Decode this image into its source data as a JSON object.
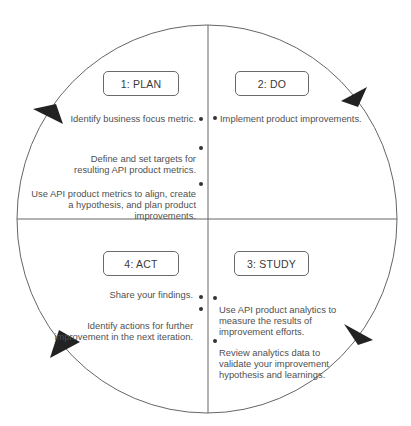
{
  "colors": {
    "line": "#666666",
    "arrow": "#222222",
    "text": "#505050",
    "box_border": "#6a6a6a"
  },
  "phases": [
    {
      "id": "plan",
      "label": "1: PLAN",
      "quadrant": "top-left",
      "items": [
        "Identify business focus metric.",
        "Define and set targets for\nresulting API product metrics.",
        "Use API product metrics to align, create\na hypothesis, and plan product\nimprovements."
      ]
    },
    {
      "id": "do",
      "label": "2: DO",
      "quadrant": "top-right",
      "items": [
        "Implement product improvements."
      ]
    },
    {
      "id": "study",
      "label": "3: STUDY",
      "quadrant": "bottom-right",
      "items": [
        "Use API product analytics to\nmeasure the results of\nimprovement efforts.",
        "Review analytics data to\nvalidate your improvement\nhypothesis and learnings."
      ]
    },
    {
      "id": "act",
      "label": "4: ACT",
      "quadrant": "bottom-left",
      "items": [
        "Share your findings.",
        "Identify actions for further\nimprovement in the next iteration."
      ]
    }
  ],
  "arrows": [
    {
      "name": "arrow-plan-to-do",
      "direction": "clockwise",
      "position": "top-left"
    },
    {
      "name": "arrow-do-to-study",
      "direction": "clockwise",
      "position": "top-right"
    },
    {
      "name": "arrow-study-to-act",
      "direction": "clockwise",
      "position": "bottom-right"
    },
    {
      "name": "arrow-act-to-plan",
      "direction": "clockwise",
      "position": "bottom-left"
    }
  ]
}
